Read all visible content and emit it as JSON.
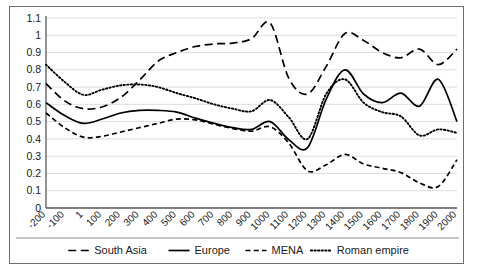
{
  "chart_data": {
    "type": "line",
    "title": "",
    "subtitle": "",
    "xlabel": "",
    "ylabel": "",
    "xlim": [
      -200,
      2000
    ],
    "ylim": [
      0,
      1.1
    ],
    "grid": true,
    "legend_position": "bottom",
    "x_tick_labels": [
      "-200",
      "-100",
      "1",
      "100",
      "200",
      "300",
      "400",
      "500",
      "600",
      "700",
      "800",
      "900",
      "1000",
      "1100",
      "1200",
      "1300",
      "1400",
      "1500",
      "1600",
      "1700",
      "1800",
      "1900",
      "2000"
    ],
    "x": [
      -200,
      -100,
      1,
      100,
      200,
      300,
      400,
      500,
      600,
      700,
      800,
      900,
      1000,
      1100,
      1200,
      1300,
      1400,
      1500,
      1600,
      1700,
      1800,
      1900,
      2000
    ],
    "y_tick_labels": [
      "0",
      "0.1",
      "0.2",
      "0.3",
      "0.4",
      "0.5",
      "0.6",
      "0.7",
      "0.8",
      "0.9",
      "1",
      "1.1"
    ],
    "y_ticks": [
      0,
      0.1,
      0.2,
      0.3,
      0.4,
      0.5,
      0.6,
      0.7,
      0.8,
      0.9,
      1.0,
      1.1
    ],
    "series": [
      {
        "name": "South Asia",
        "style": "long-dash",
        "values": [
          0.72,
          0.62,
          0.575,
          0.585,
          0.64,
          0.74,
          0.85,
          0.9,
          0.935,
          0.95,
          0.955,
          0.98,
          1.07,
          0.75,
          0.66,
          0.82,
          1.01,
          0.97,
          0.9,
          0.87,
          0.92,
          0.83,
          0.92
        ]
      },
      {
        "name": "Europe",
        "style": "solid",
        "values": [
          0.61,
          0.535,
          0.49,
          0.515,
          0.55,
          0.565,
          0.565,
          0.555,
          0.52,
          0.49,
          0.465,
          0.455,
          0.5,
          0.395,
          0.35,
          0.63,
          0.8,
          0.66,
          0.61,
          0.665,
          0.59,
          0.745,
          0.5
        ]
      },
      {
        "name": "MENA",
        "style": "short-dash",
        "values": [
          0.55,
          0.465,
          0.41,
          0.415,
          0.44,
          0.465,
          0.49,
          0.515,
          0.51,
          0.485,
          0.46,
          0.445,
          0.47,
          0.375,
          0.215,
          0.25,
          0.31,
          0.255,
          0.23,
          0.205,
          0.145,
          0.125,
          0.28
        ]
      },
      {
        "name": "Roman empire",
        "style": "dotted",
        "values": [
          0.83,
          0.73,
          0.655,
          0.685,
          0.71,
          0.715,
          0.7,
          0.665,
          0.635,
          0.6,
          0.575,
          0.56,
          0.625,
          0.525,
          0.4,
          0.66,
          0.745,
          0.61,
          0.555,
          0.53,
          0.42,
          0.455,
          0.435
        ]
      }
    ]
  },
  "legend": {
    "items": [
      {
        "label": "South Asia",
        "style": "long-dash"
      },
      {
        "label": "Europe",
        "style": "solid"
      },
      {
        "label": "MENA",
        "style": "short-dash"
      },
      {
        "label": "Roman empire",
        "style": "dotted"
      }
    ]
  },
  "colors": {
    "line": "#000000",
    "grid": "#d6d6d6",
    "axis": "#5a5a5a",
    "frame": "#6f6f6f",
    "background": "#ffffff"
  }
}
